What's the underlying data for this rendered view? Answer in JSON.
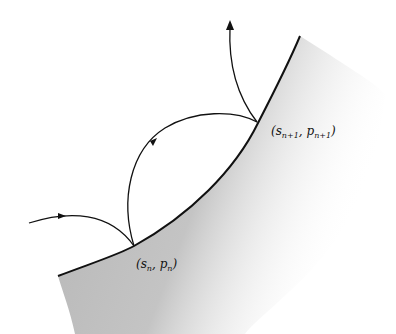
{
  "diagram": {
    "colors": {
      "line": "#111111",
      "shade": "#b8b8b8",
      "background": "#ffffff"
    },
    "points": [
      {
        "id": "n",
        "label_s": "s",
        "label_p": "p",
        "sub": "n",
        "x": 134,
        "y": 246
      },
      {
        "id": "n1",
        "label_s": "s",
        "label_p": "p",
        "sub": "n+1",
        "x": 257,
        "y": 122
      }
    ],
    "labels": {
      "point_n": {
        "open": "(",
        "s": "s",
        "sub_s": "n",
        "sep": ", ",
        "p": "p",
        "sub_p": "n",
        "close": ")"
      },
      "point_n1": {
        "open": "(",
        "s": "s",
        "sub_s": "n+1",
        "sep": ", ",
        "p": "p",
        "sub_p": "n+1",
        "close": ")"
      }
    }
  }
}
